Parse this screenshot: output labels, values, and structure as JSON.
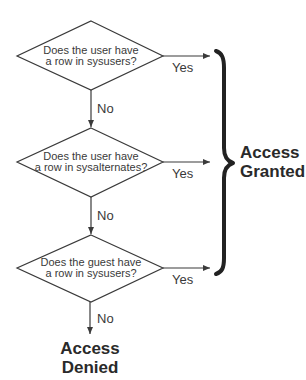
{
  "diagram": {
    "type": "flowchart",
    "decisions": [
      {
        "id": "d1",
        "line1": "Does the user have",
        "line2": "a row in sysusers?",
        "yes_label": "Yes",
        "no_label": "No"
      },
      {
        "id": "d2",
        "line1": "Does the user have",
        "line2": "a row in sysalternates?",
        "yes_label": "Yes",
        "no_label": "No"
      },
      {
        "id": "d3",
        "line1": "Does the guest have",
        "line2": "a row in sysusers?",
        "yes_label": "Yes",
        "no_label": "No"
      }
    ],
    "outcomes": {
      "granted": {
        "line1": "Access",
        "line2": "Granted"
      },
      "denied": {
        "line1": "Access",
        "line2": "Denied"
      }
    },
    "colors": {
      "stroke": "#3a3a3a",
      "brace": "#222222",
      "background": "#ffffff"
    }
  }
}
